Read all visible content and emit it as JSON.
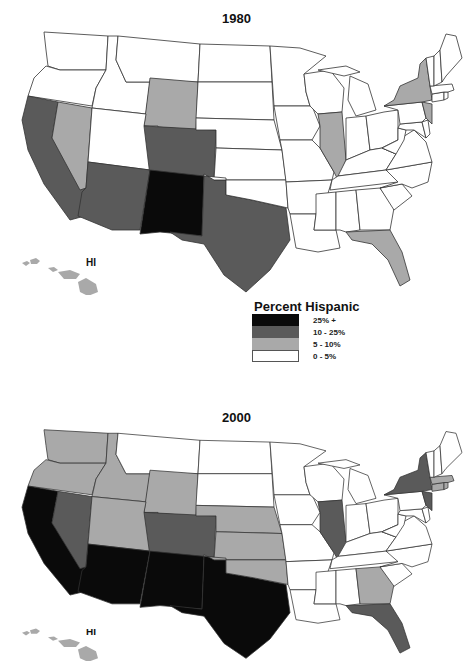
{
  "legend": {
    "title": "Percent Hispanic",
    "classes": [
      {
        "label": "25% +",
        "color": "#0a0a0a"
      },
      {
        "label": "10 - 25%",
        "color": "#5a5a5a"
      },
      {
        "label": "5 - 10%",
        "color": "#a9a9a9"
      },
      {
        "label": "0 - 5%",
        "color": "#ffffff"
      }
    ]
  },
  "maps": [
    {
      "title": "1980",
      "hawaii_label": "HI",
      "states": {
        "WA": "0-5",
        "OR": "0-5",
        "CA": "10-25",
        "NV": "5-10",
        "ID": "0-5",
        "MT": "0-5",
        "WY": "5-10",
        "UT": "0-5",
        "AZ": "10-25",
        "CO": "10-25",
        "NM": "25+",
        "TX": "10-25",
        "ND": "0-5",
        "SD": "0-5",
        "NE": "0-5",
        "KS": "0-5",
        "OK": "0-5",
        "MN": "0-5",
        "IA": "0-5",
        "MO": "0-5",
        "AR": "0-5",
        "LA": "0-5",
        "WI": "0-5",
        "IL": "5-10",
        "MI": "0-5",
        "IN": "0-5",
        "OH": "0-5",
        "KY": "0-5",
        "TN": "0-5",
        "MS": "0-5",
        "AL": "0-5",
        "GA": "0-5",
        "FL": "5-10",
        "SC": "0-5",
        "NC": "0-5",
        "VA": "0-5",
        "WV": "0-5",
        "MD": "0-5",
        "DE": "0-5",
        "PA": "0-5",
        "NJ": "5-10",
        "NY": "5-10",
        "CT": "0-5",
        "RI": "0-5",
        "MA": "0-5",
        "VT": "0-5",
        "NH": "0-5",
        "ME": "0-5",
        "HI": "5-10"
      }
    },
    {
      "title": "2000",
      "hawaii_label": "HI",
      "states": {
        "WA": "5-10",
        "OR": "5-10",
        "CA": "25+",
        "NV": "10-25",
        "ID": "5-10",
        "MT": "0-5",
        "WY": "5-10",
        "UT": "5-10",
        "AZ": "25+",
        "CO": "10-25",
        "NM": "25+",
        "TX": "25+",
        "ND": "0-5",
        "SD": "0-5",
        "NE": "5-10",
        "KS": "5-10",
        "OK": "5-10",
        "MN": "0-5",
        "IA": "0-5",
        "MO": "0-5",
        "AR": "0-5",
        "LA": "0-5",
        "WI": "0-5",
        "IL": "10-25",
        "MI": "0-5",
        "IN": "0-5",
        "OH": "0-5",
        "KY": "0-5",
        "TN": "0-5",
        "MS": "0-5",
        "AL": "0-5",
        "GA": "5-10",
        "FL": "10-25",
        "SC": "0-5",
        "NC": "0-5",
        "VA": "0-5",
        "WV": "0-5",
        "MD": "0-5",
        "DE": "0-5",
        "PA": "0-5",
        "NJ": "10-25",
        "NY": "10-25",
        "CT": "5-10",
        "RI": "5-10",
        "MA": "5-10",
        "VT": "0-5",
        "NH": "0-5",
        "ME": "0-5",
        "HI": "5-10"
      }
    }
  ]
}
